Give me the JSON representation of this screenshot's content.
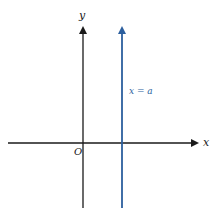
{
  "diagram": {
    "axes": {
      "x_label": "x",
      "y_label": "y",
      "origin_label": "O"
    },
    "line": {
      "label": "x = a",
      "color": "#2c5f9e"
    },
    "axis_color": "#1a1a1a"
  }
}
